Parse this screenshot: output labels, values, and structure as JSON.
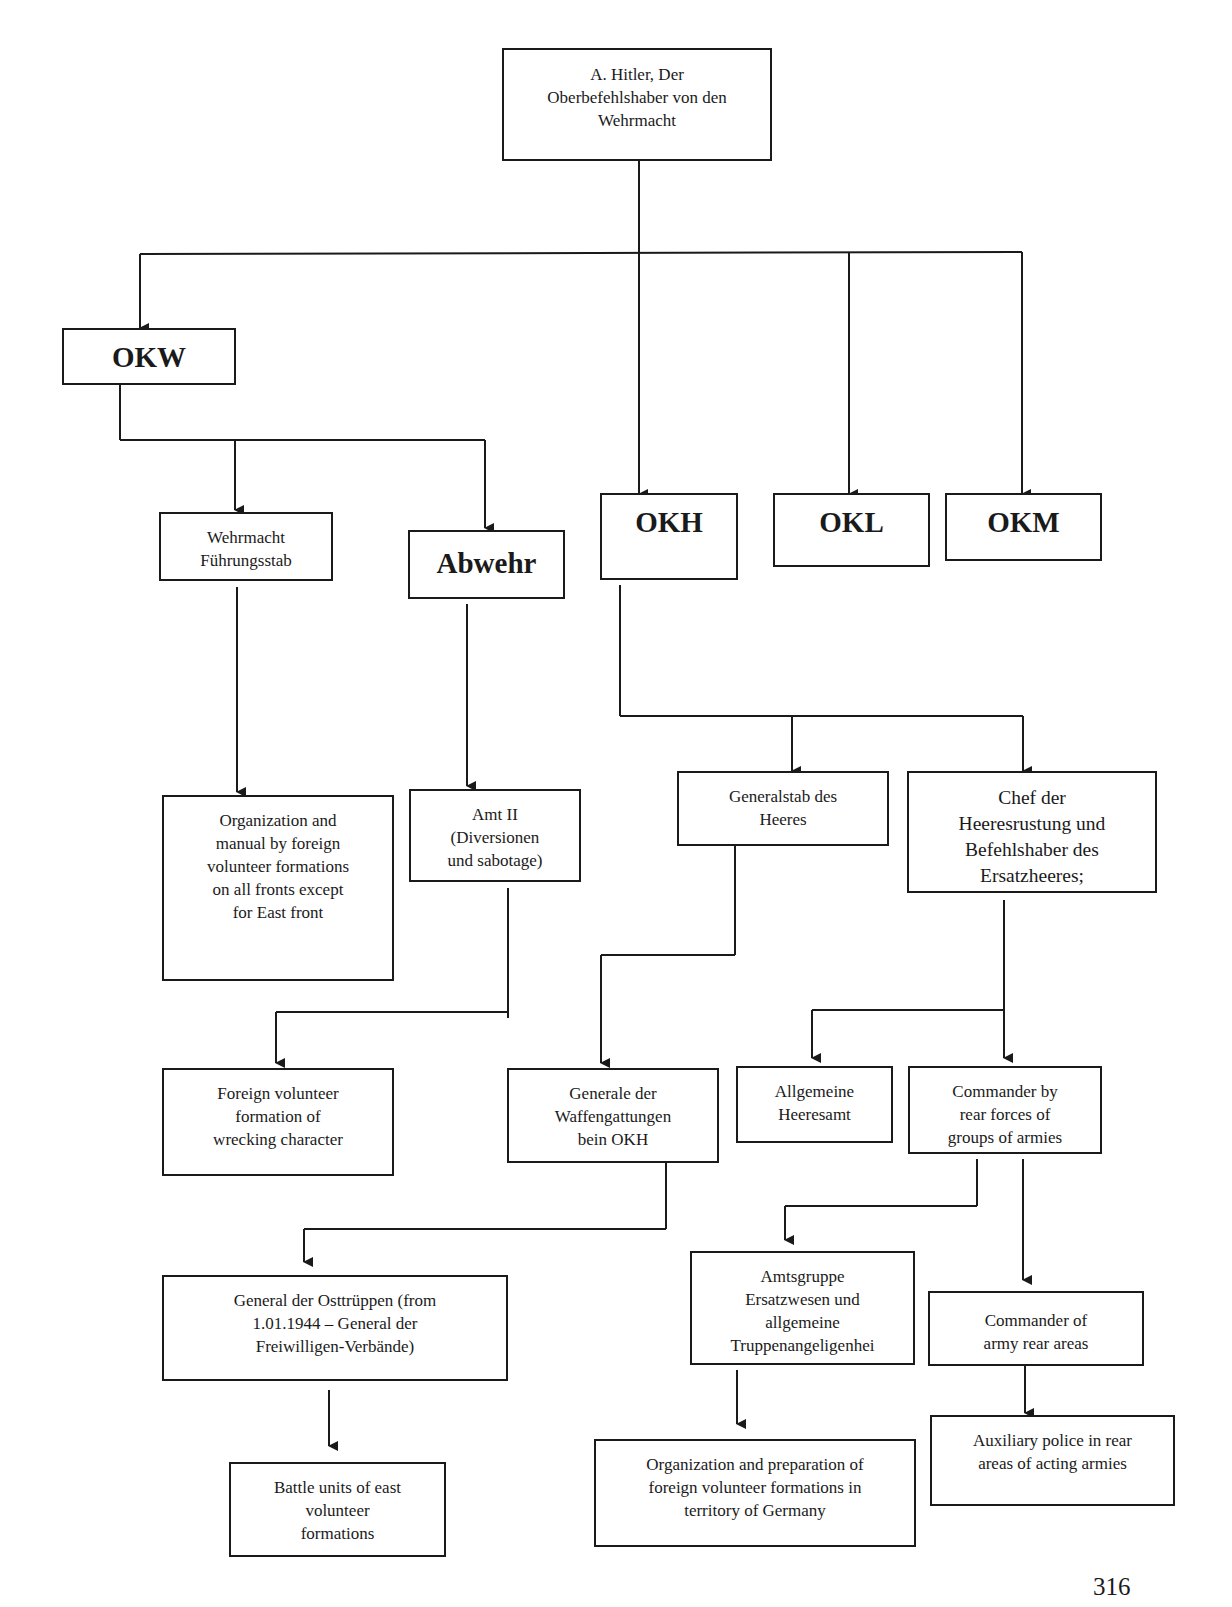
{
  "diagram": {
    "nodes": {
      "hitler": {
        "label": "A. Hitler, Der\nOberbefehlshaber von den\nWehrmacht"
      },
      "okw": {
        "label": "OKW"
      },
      "okh": {
        "label": "OKH"
      },
      "okl": {
        "label": "OKL"
      },
      "okm": {
        "label": "OKM"
      },
      "wfst": {
        "label": "Wehrmacht\nFührungsstab"
      },
      "abwehr": {
        "label": "Abwehr"
      },
      "org_manual": {
        "label": "Organization and\nmanual by foreign\nvolunteer formations\non all fronts except\nfor East front"
      },
      "amt2": {
        "label": "Amt II\n(Diversionen\nund sabotage)"
      },
      "genstab": {
        "label": "Generalstab des\nHeeres"
      },
      "chef": {
        "label": "Chef der\nHeeresrustung und\nBefehlshaber des\nErsatzheeres;"
      },
      "foreign_wrecking": {
        "label": "Foreign volunteer\nformation of\nwrecking character"
      },
      "gen_waffen": {
        "label": "Generale der\nWaffengattungen\nbein OKH"
      },
      "allg_heeresamt": {
        "label": "Allgemeine\nHeeresamt"
      },
      "cmdr_groups": {
        "label": "Commander by\nrear forces of\ngroups of armies"
      },
      "gen_osttruppen": {
        "label": "General der Osttrüppen (from\n1.01.1944 – General der\nFreiwilligen-Verbände)"
      },
      "amtsgruppe": {
        "label": "Amtsgruppe\nErsatzwesen und\nallgemeine\nTruppenangeligenhei"
      },
      "cmdr_army_rear": {
        "label": "Commander of\narmy rear areas"
      },
      "battle_units": {
        "label": "Battle units of east\nvolunteer\nformations"
      },
      "org_prep": {
        "label": "Organization and preparation of\nforeign volunteer formations in\nterritory of Germany"
      },
      "aux_police": {
        "label": "Auxiliary police in rear\nareas of acting armies"
      }
    },
    "edges": [
      [
        "hitler",
        "okw"
      ],
      [
        "hitler",
        "okh"
      ],
      [
        "hitler",
        "okl"
      ],
      [
        "hitler",
        "okm"
      ],
      [
        "okw",
        "wfst"
      ],
      [
        "okw",
        "abwehr"
      ],
      [
        "wfst",
        "org_manual"
      ],
      [
        "abwehr",
        "amt2"
      ],
      [
        "amt2",
        "foreign_wrecking"
      ],
      [
        "okh",
        "genstab"
      ],
      [
        "okh",
        "chef"
      ],
      [
        "genstab",
        "gen_waffen"
      ],
      [
        "chef",
        "allg_heeresamt"
      ],
      [
        "chef",
        "cmdr_groups"
      ],
      [
        "gen_waffen",
        "gen_osttruppen"
      ],
      [
        "gen_osttruppen",
        "battle_units"
      ],
      [
        "cmdr_groups",
        "amtsgruppe"
      ],
      [
        "cmdr_groups",
        "cmdr_army_rear"
      ],
      [
        "amtsgruppe",
        "org_prep"
      ],
      [
        "cmdr_army_rear",
        "aux_police"
      ]
    ],
    "line_color": "#1a1a1a"
  },
  "page_number": "316"
}
